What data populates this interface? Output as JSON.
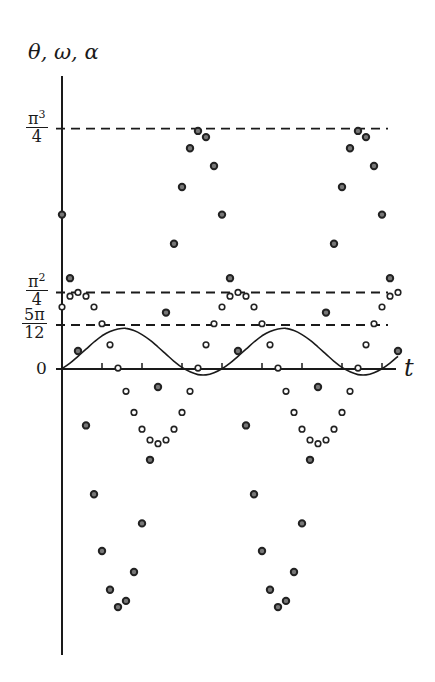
{
  "chart_data": {
    "type": "line",
    "title": "",
    "xlabel": "t",
    "ylabel": "θ, ω, α",
    "xlim": [
      0,
      10.5
    ],
    "ylim": [
      -8.8,
      9.3
    ],
    "grid": false,
    "legend": null,
    "reference_lines": [
      {
        "label_num": "π",
        "label_exp": "3",
        "label_den": "4",
        "value": 7.752
      },
      {
        "label_num": "π",
        "label_exp": "2",
        "label_den": "4",
        "value": 2.467
      },
      {
        "label_num": "5π",
        "label_exp": "",
        "label_den": "12",
        "value": 1.309
      }
    ],
    "zero_label": "0",
    "x_ticks": [
      1.25,
      2.5,
      3.75,
      5.0,
      6.25,
      7.5,
      8.75,
      10.0
    ],
    "x": [
      0,
      0.25,
      0.5,
      0.75,
      1,
      1.25,
      1.5,
      1.75,
      2,
      2.25,
      2.5,
      2.75,
      3,
      3.25,
      3.5,
      3.75,
      4,
      4.25,
      4.5,
      4.75,
      5,
      5.25,
      5.5,
      5.75,
      6,
      6.25,
      6.5,
      6.75,
      7,
      7.25,
      7.5,
      7.75,
      8,
      8.25,
      8.5,
      8.75,
      9,
      9.25,
      9.5,
      9.75,
      10,
      10.25,
      10.5
    ],
    "series": [
      {
        "name": "θ",
        "style": "solid-line",
        "values": [
          0.01,
          0.19,
          0.41,
          0.64,
          0.87,
          1.07,
          1.21,
          1.29,
          1.31,
          1.24,
          1.11,
          0.93,
          0.71,
          0.48,
          0.25,
          0.05,
          -0.09,
          -0.18,
          -0.19,
          -0.12,
          0.01,
          0.19,
          0.41,
          0.64,
          0.87,
          1.07,
          1.21,
          1.29,
          1.31,
          1.24,
          1.11,
          0.93,
          0.71,
          0.48,
          0.25,
          0.05,
          -0.09,
          -0.18,
          -0.19,
          -0.12,
          0.01,
          0.19,
          0.41
        ]
      },
      {
        "name": "ω",
        "style": "open-circles",
        "values": [
          2.0,
          2.35,
          2.47,
          2.35,
          2.0,
          1.46,
          0.78,
          0.03,
          -0.72,
          -1.4,
          -1.94,
          -2.29,
          -2.41,
          -2.29,
          -1.94,
          -1.4,
          -0.72,
          0.03,
          0.78,
          1.46,
          2.0,
          2.35,
          2.47,
          2.35,
          2.0,
          1.46,
          0.78,
          0.03,
          -0.72,
          -1.4,
          -1.94,
          -2.29,
          -2.41,
          -2.29,
          -1.94,
          -1.4,
          -0.72,
          0.03,
          0.78,
          1.46,
          2.0,
          2.35,
          2.47
        ]
      },
      {
        "name": "α",
        "style": "filled-diamonds",
        "values": [
          4.98,
          2.93,
          0.58,
          -1.82,
          -4.04,
          -5.87,
          -7.12,
          -7.68,
          -7.48,
          -6.55,
          -4.98,
          -2.93,
          -0.58,
          1.82,
          4.04,
          5.87,
          7.12,
          7.68,
          7.48,
          6.55,
          4.98,
          2.93,
          0.58,
          -1.82,
          -4.04,
          -5.87,
          -7.12,
          -7.68,
          -7.48,
          -6.55,
          -4.98,
          -2.93,
          -0.58,
          1.82,
          4.04,
          5.87,
          7.12,
          7.68,
          7.48,
          6.55,
          4.98,
          2.93,
          0.58
        ]
      }
    ]
  }
}
